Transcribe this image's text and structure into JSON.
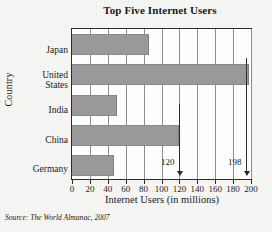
{
  "chart_data": {
    "type": "bar",
    "orientation": "horizontal",
    "title": "Top Five Internet Users",
    "xlabel": "Internet Users (in millions)",
    "ylabel": "Country",
    "categories": [
      "Japan",
      "United States",
      "India",
      "China",
      "Germany"
    ],
    "values": [
      86,
      198,
      50,
      120,
      47
    ],
    "xlim": [
      0,
      200
    ],
    "xticks": [
      0,
      20,
      40,
      60,
      80,
      100,
      120,
      140,
      160,
      180,
      200
    ],
    "xtick_labels": [
      "0",
      "20",
      "40",
      "60",
      "80",
      "100",
      "120",
      "140",
      "160",
      "180",
      "200"
    ],
    "grid": "vertical",
    "legend": "none",
    "bar_color": "#9a9a9a",
    "annotations": [
      {
        "text": "120",
        "value": 120,
        "target_category": "China"
      },
      {
        "text": "198",
        "value": 198,
        "target_category": "United States"
      }
    ],
    "source": "Source: The World Almanac, 2007",
    "source_prefix": "Source:",
    "source_body": "The World Almanac, 2007"
  }
}
